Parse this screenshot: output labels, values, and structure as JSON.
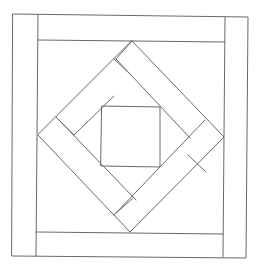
{
  "diagram": {
    "title": "",
    "stroke_color": "#6a6a6a",
    "background": "#ffffff",
    "width": 256,
    "height": 271,
    "shapes": {
      "outer_square": [
        [
          13,
          14
        ],
        [
          248,
          17
        ],
        [
          246,
          258
        ],
        [
          12,
          256
        ]
      ],
      "border_lines": [
        {
          "name": "left-strip-inner-edge",
          "pts": [
            [
              38,
              15
            ],
            [
              36,
              256
            ]
          ]
        },
        {
          "name": "right-strip-inner-edge",
          "pts": [
            [
              225,
              17
            ],
            [
              223,
              257
            ]
          ]
        },
        {
          "name": "top-strip-inner-edge",
          "pts": [
            [
              38,
              40
            ],
            [
              225,
              42
            ]
          ]
        },
        {
          "name": "bottom-strip-inner-edge",
          "pts": [
            [
              36,
              232
            ],
            [
              223,
              234
            ]
          ]
        }
      ],
      "diamond_outer": [
        [
          132,
          41
        ],
        [
          224,
          137
        ],
        [
          130,
          232
        ],
        [
          38,
          135
        ]
      ],
      "center_square": [
        [
          102,
          106
        ],
        [
          160,
          107
        ],
        [
          160,
          167
        ],
        [
          101,
          166
        ]
      ],
      "band_lines": [
        {
          "name": "ul-band-inner-edge",
          "pts": [
            [
              74,
              135
            ],
            [
              114,
              96
            ]
          ]
        },
        {
          "name": "ul-band-end-cap",
          "pts": [
            [
              56,
              117
            ],
            [
              74,
              135
            ]
          ]
        },
        {
          "name": "tr-band-inner-edge",
          "pts": [
            [
              116,
              59
            ],
            [
              190,
              138
            ]
          ]
        },
        {
          "name": "tr-band-end-cap",
          "pts": [
            [
              132,
              41
            ],
            [
              116,
              59
            ]
          ]
        },
        {
          "name": "tr-band-cap-2",
          "pts": [
            [
              114,
              59
            ],
            [
              132,
              76
            ]
          ]
        },
        {
          "name": "ll-band-inner-edge",
          "pts": [
            [
              56,
              117
            ],
            [
              136,
              200
            ]
          ]
        },
        {
          "name": "lr-band-inner-edge",
          "pts": [
            [
              114,
              215
            ],
            [
              205,
              120
            ]
          ]
        },
        {
          "name": "lr-band-end-cap",
          "pts": [
            [
              188,
              155
            ],
            [
              206,
              172
            ]
          ]
        },
        {
          "name": "ll-band-end-cap",
          "pts": [
            [
              114,
              215
            ],
            [
              133,
              198
            ]
          ]
        }
      ]
    }
  }
}
